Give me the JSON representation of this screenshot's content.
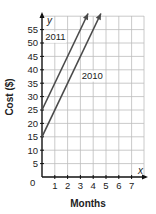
{
  "chart_data": {
    "type": "line",
    "title": "",
    "xlabel": "Months",
    "ylabel": "Cost ($)",
    "x_axis_var": "x",
    "y_axis_var": "y",
    "origin_label": "0",
    "x_ticks": [
      "1",
      "2",
      "3",
      "4",
      "5",
      "6",
      "7"
    ],
    "y_ticks": [
      "5",
      "10",
      "15",
      "20",
      "25",
      "30",
      "35",
      "40",
      "45",
      "50",
      "55"
    ],
    "xlim": [
      0,
      8
    ],
    "ylim": [
      0,
      60
    ],
    "grid": true,
    "series": [
      {
        "name": "2011",
        "x": [
          0,
          3.6
        ],
        "y": [
          25,
          61
        ],
        "slope": 10,
        "intercept": 25,
        "color": "#4a4a4a"
      },
      {
        "name": "2010",
        "x": [
          0,
          4.6
        ],
        "y": [
          15,
          61
        ],
        "slope": 10,
        "intercept": 15,
        "color": "#4a4a4a"
      }
    ],
    "annotations": [
      {
        "text": "2011",
        "x": 0.25,
        "y": 51
      },
      {
        "text": "2010",
        "x": 3.1,
        "y": 36.5
      }
    ]
  }
}
